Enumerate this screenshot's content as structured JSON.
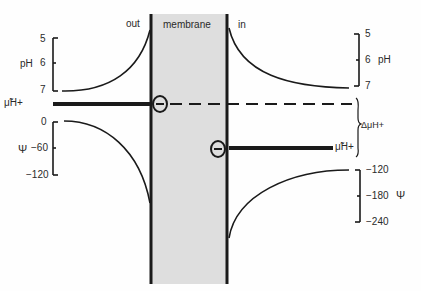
{
  "labels": {
    "out": "out",
    "membrane": "membrane",
    "in": "in",
    "mu_h_left": "μ̃H+",
    "mu_h_right": "μ̃H+",
    "delta_mu_h": "ΔμH+"
  },
  "left_ph_axis": {
    "label": "pH",
    "ticks": [
      "5",
      "6",
      "7"
    ]
  },
  "left_psi_axis": {
    "label": "Ψ",
    "ticks": [
      "0",
      "−60",
      "−120"
    ]
  },
  "right_ph_axis": {
    "label": "pH",
    "ticks": [
      "5",
      "6",
      "7"
    ]
  },
  "right_psi_axis": {
    "label": "Ψ",
    "ticks": [
      "−120",
      "−180",
      "−240"
    ]
  },
  "symbols": {
    "negative_charge": "−"
  },
  "colors": {
    "membrane_fill": "#dcdcdc",
    "line": "#1a1a1a"
  }
}
